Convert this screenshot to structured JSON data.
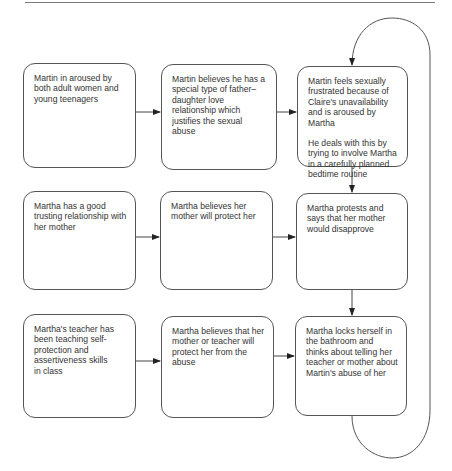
{
  "diagram": {
    "type": "flowchart",
    "rows": [
      {
        "boxes": [
          {
            "id": "b1",
            "paragraphs": [
              "Martin in aroused by both adult women and young teenagers"
            ]
          },
          {
            "id": "b2",
            "paragraphs": [
              "Martin believes he has a special type of father–daughter love relationship which justifies the sexual abuse"
            ]
          },
          {
            "id": "b3",
            "paragraphs": [
              "Martin feels sexually frustrated because of Claire's unavailability and is aroused by Martha",
              "He deals with this by trying to involve Martha in a carefully planned bedtime routine"
            ]
          }
        ]
      },
      {
        "boxes": [
          {
            "id": "b4",
            "paragraphs": [
              "Martha has a good trusting relationship with her mother"
            ]
          },
          {
            "id": "b5",
            "paragraphs": [
              "Martha believes her mother will protect her"
            ]
          },
          {
            "id": "b6",
            "paragraphs": [
              "Martha protests and says that her mother would disapprove"
            ]
          }
        ]
      },
      {
        "boxes": [
          {
            "id": "b7",
            "paragraphs": [
              "Martha's teacher has been teaching self-protection and assertiveness skills\nin class"
            ]
          },
          {
            "id": "b8",
            "paragraphs": [
              "Martha believes that her mother or teacher will protect her from the abuse"
            ]
          },
          {
            "id": "b9",
            "paragraphs": [
              "Martha locks herself in the bathroom and thinks about telling her teacher or mother about Martin's abuse of her"
            ]
          }
        ]
      }
    ],
    "edges": [
      {
        "from": "b1",
        "to": "b2"
      },
      {
        "from": "b2",
        "to": "b3"
      },
      {
        "from": "b4",
        "to": "b5"
      },
      {
        "from": "b5",
        "to": "b6"
      },
      {
        "from": "b7",
        "to": "b8"
      },
      {
        "from": "b8",
        "to": "b9"
      },
      {
        "from": "b3",
        "to": "b6"
      },
      {
        "from": "b6",
        "to": "b9"
      },
      {
        "from": "b9",
        "to": "b3",
        "style": "loop-back"
      }
    ],
    "colors": {
      "line": "#555555",
      "text": "#333333",
      "background": "#ffffff"
    }
  }
}
